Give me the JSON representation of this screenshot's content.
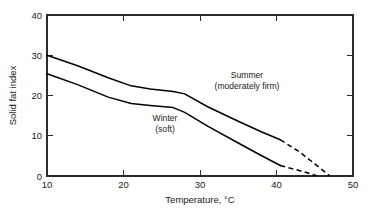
{
  "chart_data": {
    "type": "line",
    "title": "",
    "xlabel": "Temperature, °C",
    "ylabel": "Solid fat index",
    "xlim": [
      10,
      50
    ],
    "ylim": [
      0,
      40
    ],
    "xticks": [
      10,
      20,
      30,
      40,
      50
    ],
    "yticks": [
      0,
      10,
      20,
      30,
      40
    ],
    "xtick_labels": [
      "10",
      "20",
      "30",
      "40",
      "50"
    ],
    "ytick_labels": [
      "0",
      "10",
      "20",
      "30",
      "40"
    ],
    "grid": false,
    "legend_position": "inline-annotations",
    "series": [
      {
        "name": "Summer",
        "annotation_line1": "Summer",
        "annotation_line2": "(moderately firm)",
        "solid_x": [
          10,
          14,
          18,
          21,
          23.5,
          26.5,
          28,
          31,
          35,
          38,
          40.5
        ],
        "solid_y": [
          30.0,
          27.4,
          24.4,
          22.4,
          21.6,
          21.0,
          20.4,
          17.2,
          13.6,
          11.0,
          9.0
        ],
        "dashed_x": [
          40.5,
          43,
          45,
          47
        ],
        "dashed_y": [
          9.0,
          6.0,
          3.0,
          0.0
        ]
      },
      {
        "name": "Winter",
        "annotation_line1": "Winter",
        "annotation_line2": "(soft)",
        "solid_x": [
          10,
          14,
          18,
          21,
          23.5,
          26.5,
          28,
          31,
          35,
          38,
          40.5
        ],
        "solid_y": [
          25.4,
          22.7,
          19.6,
          18.0,
          17.5,
          17.0,
          15.8,
          12.4,
          8.2,
          5.1,
          2.6
        ],
        "dashed_x": [
          40.5,
          42.5,
          44,
          45.3
        ],
        "dashed_y": [
          2.6,
          1.6,
          0.8,
          0.0
        ]
      }
    ]
  },
  "axes": {
    "x_title": "Temperature, °C",
    "y_title": "Solid fat index",
    "x_tick_labels": [
      "10",
      "20",
      "30",
      "40",
      "50"
    ],
    "y_tick_labels": [
      "0",
      "10",
      "20",
      "30",
      "40"
    ]
  },
  "annotations": {
    "summer_line1": "Summer",
    "summer_line2": "(moderately firm)",
    "winter_line1": "Winter",
    "winter_line2": "(soft)"
  },
  "colors": {
    "background": "#ffffff",
    "frame": "#2b2b2b",
    "curve": "#000000",
    "text": "#1a1a1a"
  }
}
